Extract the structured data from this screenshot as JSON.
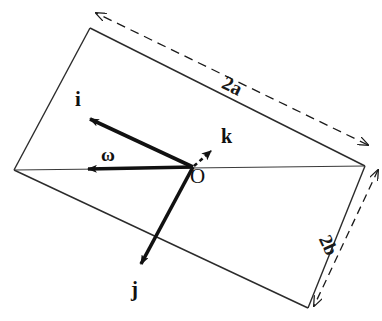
{
  "figure": {
    "background_color": "#ffffff",
    "ink_color": "#1a1a1a",
    "width": 382,
    "height": 321
  },
  "plate": {
    "name": "rectangular-plate",
    "corners": {
      "top_left": {
        "x": 90,
        "y": 28
      },
      "right": {
        "x": 365,
        "y": 166
      },
      "bottom_right": {
        "x": 308,
        "y": 308
      },
      "left": {
        "x": 14,
        "y": 170
      }
    },
    "outline_color": "#2b2b2b",
    "outline_width": 1.3
  },
  "origin": {
    "label": "O",
    "x": 193,
    "y": 167
  },
  "vectors": [
    {
      "id": "i",
      "label": "i",
      "style": "solid",
      "color": "#111111",
      "from": {
        "x": 193,
        "y": 167
      },
      "to": {
        "x": 87,
        "y": 117
      },
      "label_pos": {
        "x": 82,
        "y": 98
      }
    },
    {
      "id": "j",
      "label": "j",
      "style": "solid",
      "color": "#111111",
      "from": {
        "x": 193,
        "y": 167
      },
      "to": {
        "x": 140,
        "y": 269
      },
      "label_pos": {
        "x": 137,
        "y": 290
      }
    },
    {
      "id": "k",
      "label": "k",
      "style": "dashed",
      "color": "#111111",
      "from": {
        "x": 193,
        "y": 167
      },
      "to": {
        "x": 216,
        "y": 147
      },
      "label_pos": {
        "x": 228,
        "y": 136
      }
    },
    {
      "id": "omega",
      "label": "ω",
      "style": "solid",
      "color": "#111111",
      "from": {
        "x": 193,
        "y": 167
      },
      "to": {
        "x": 86,
        "y": 169
      },
      "label_pos": {
        "x": 110,
        "y": 155
      }
    }
  ],
  "dimensions": [
    {
      "id": "2a",
      "label": "2a",
      "style": "dashed-double-arrow",
      "from": {
        "x": 368,
        "y": 145
      },
      "to": {
        "x": 96,
        "y": 13
      },
      "label_pos": {
        "x": 242,
        "y": 84
      },
      "label_rotation_deg": 26.5
    },
    {
      "id": "2b",
      "label": "2b",
      "style": "dashed-double-arrow",
      "from": {
        "x": 378,
        "y": 170
      },
      "to": {
        "x": 314,
        "y": 306
      },
      "label_pos": {
        "x": 343,
        "y": 244
      },
      "label_rotation_deg": 65
    }
  ],
  "icons": {
    "arrowhead": "arrowhead-icon",
    "dashed_arrowhead": "dashed-arrowhead-icon"
  }
}
